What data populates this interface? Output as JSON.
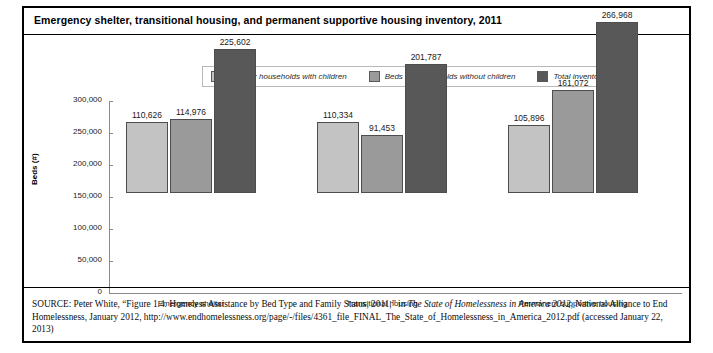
{
  "figure": {
    "title": "Emergency shelter, transitional housing, and permanent supportive housing inventory, 2011"
  },
  "chart_data": {
    "type": "bar",
    "title": "Emergency shelter, transitional housing, and permanent supportive housing inventory, 2011",
    "xlabel": "",
    "ylabel": "Beds (#)",
    "ylim": [
      0,
      300000
    ],
    "ytick_labels": [
      "300,000",
      "250,000",
      "200,000",
      "150,000",
      "100,000",
      "50,000",
      "0"
    ],
    "ytick_values": [
      300000,
      250000,
      200000,
      150000,
      100000,
      50000,
      0
    ],
    "grid": false,
    "legend_position": "top-center",
    "categories": [
      "Emergency shelter",
      "Transitional housing",
      "Permanent supportive housing"
    ],
    "series": [
      {
        "name": "Beds for households with children",
        "color": "#c3c3c3",
        "values": [
          110626,
          114976,
          105896
        ],
        "labels": [
          "110,626",
          "110,334",
          "105,896"
        ]
      },
      {
        "name": "Beds for households without children",
        "color": "#9a9a9a",
        "values": [
          114976,
          91453,
          161072
        ],
        "labels": [
          "114,976",
          "91,453",
          "161,072"
        ]
      },
      {
        "name": "Total inventory",
        "color": "#585858",
        "values": [
          225602,
          201787,
          266968
        ],
        "labels": [
          "225,602",
          "201,787",
          "266,968"
        ]
      }
    ],
    "groups": [
      {
        "category": "Emergency shelter",
        "bars": [
          {
            "series": "Beds for households with children",
            "value": 110626,
            "label": "110,626"
          },
          {
            "series": "Beds for households without children",
            "value": 114976,
            "label": "114,976"
          },
          {
            "series": "Total inventory",
            "value": 225602,
            "label": "225,602"
          }
        ]
      },
      {
        "category": "Transitional housing",
        "bars": [
          {
            "series": "Beds for households with children",
            "value": 110334,
            "label": "110,334"
          },
          {
            "series": "Beds for households without children",
            "value": 91453,
            "label": "91,453"
          },
          {
            "series": "Total inventory",
            "value": 201787,
            "label": "201,787"
          }
        ]
      },
      {
        "category": "Permanent supportive housing",
        "bars": [
          {
            "series": "Beds for households with children",
            "value": 105896,
            "label": "105,896"
          },
          {
            "series": "Beds for households without children",
            "value": 161072,
            "label": "161,072"
          },
          {
            "series": "Total inventory",
            "value": 266968,
            "label": "266,968"
          }
        ]
      }
    ]
  },
  "source": {
    "label": "SOURCE:",
    "part1": " Peter White, “Figure 1.4. Homeless Assistance by Bed Type and Family Status, 2011,” in ",
    "italic1": "The State of Homelessness in America 2012",
    "part2": ", National Alliance to End Homelessness, January 2012, http://www.endhomelessness.org/page/-/files/4361_file_FINAL_The_State_of_Homelessness_in_America_2012.pdf (accessed January 22, 2013)"
  }
}
